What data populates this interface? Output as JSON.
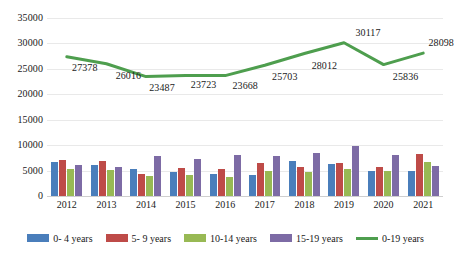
{
  "chart_data": {
    "type": "bar",
    "title": "",
    "xlabel": "",
    "ylabel": "",
    "ylim": [
      0,
      35000
    ],
    "ytick_step": 5000,
    "yticks": [
      "0",
      "5000",
      "10000",
      "15000",
      "20000",
      "25000",
      "30000",
      "35000"
    ],
    "grid": true,
    "legend_position": "bottom",
    "categories": [
      "2012",
      "2013",
      "2014",
      "2015",
      "2016",
      "2017",
      "2018",
      "2019",
      "2020",
      "2021"
    ],
    "series": [
      {
        "name": "0- 4 years",
        "type": "bar",
        "color": "#4A7EBB",
        "values": [
          6600,
          6100,
          5400,
          4800,
          4400,
          4200,
          6800,
          6300,
          5000,
          4950
        ]
      },
      {
        "name": "5- 9 years",
        "type": "bar",
        "color": "#BE4B48",
        "values": [
          7000,
          6800,
          4350,
          5500,
          5350,
          6450,
          5750,
          6500,
          5650,
          8250
        ]
      },
      {
        "name": "10-14 years",
        "type": "bar",
        "color": "#98B954",
        "values": [
          5350,
          5050,
          3950,
          4050,
          3800,
          5000,
          4800,
          5350,
          4900,
          6700
        ]
      },
      {
        "name": "15-19 years",
        "type": "bar",
        "color": "#7D6BA5",
        "values": [
          6050,
          5700,
          7900,
          7200,
          8050,
          7900,
          8500,
          9900,
          8100,
          5900
        ]
      },
      {
        "name": "0-19 years",
        "type": "line",
        "color": "#4E9E4E",
        "values": [
          27378,
          26016,
          23487,
          23723,
          23668,
          25703,
          28012,
          30117,
          25836,
          28098
        ],
        "data_labels": [
          "27378",
          "26016",
          "23487",
          "23723",
          "23668",
          "25703",
          "28012",
          "30117",
          "25836",
          "28098"
        ]
      }
    ]
  },
  "legend": {
    "items": [
      {
        "label": "0- 4 years",
        "color": "#4A7EBB",
        "shape": "bar-swatch"
      },
      {
        "label": "5- 9 years",
        "color": "#BE4B48",
        "shape": "bar-swatch"
      },
      {
        "label": "10-14 years",
        "color": "#98B954",
        "shape": "bar-swatch"
      },
      {
        "label": "15-19 years",
        "color": "#7D6BA5",
        "shape": "bar-swatch"
      },
      {
        "label": "0-19 years",
        "color": "#4E9E4E",
        "shape": "line-swatch"
      }
    ]
  }
}
